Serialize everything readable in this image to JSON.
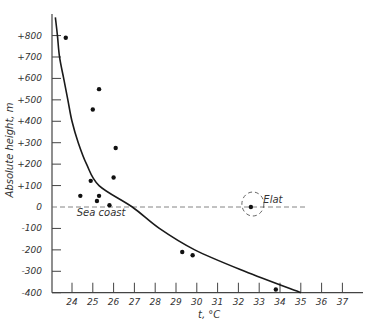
{
  "chart_data": {
    "type": "scatter",
    "title": "",
    "xlabel": "t, °C",
    "ylabel": "Absolute height, m",
    "xlim": [
      23,
      38
    ],
    "ylim": [
      -400,
      900
    ],
    "x_ticks": [
      24,
      25,
      26,
      27,
      28,
      29,
      30,
      31,
      32,
      33,
      34,
      35,
      36,
      37
    ],
    "y_ticks": [
      -400,
      -300,
      -200,
      -100,
      0,
      100,
      200,
      300,
      400,
      500,
      600,
      700,
      800
    ],
    "y_tick_labels": [
      "-400",
      "-300",
      "-200",
      "-100",
      "0",
      "+100",
      "+200",
      "+300",
      "+400",
      "+500",
      "+600",
      "+700",
      "+800"
    ],
    "grid": false,
    "legend": null,
    "series": [
      {
        "name": "Observed stations",
        "type": "scatter",
        "points": [
          {
            "t": 23.7,
            "h": 790
          },
          {
            "t": 25.3,
            "h": 550
          },
          {
            "t": 25.0,
            "h": 455
          },
          {
            "t": 26.1,
            "h": 275
          },
          {
            "t": 26.0,
            "h": 138
          },
          {
            "t": 24.9,
            "h": 122
          },
          {
            "t": 24.4,
            "h": 52
          },
          {
            "t": 25.3,
            "h": 52
          },
          {
            "t": 25.2,
            "h": 28
          },
          {
            "t": 25.8,
            "h": 8
          },
          {
            "t": 32.6,
            "h": 0
          },
          {
            "t": 29.3,
            "h": -210
          },
          {
            "t": 29.8,
            "h": -225
          },
          {
            "t": 33.8,
            "h": -385
          }
        ]
      },
      {
        "name": "Fitted curve",
        "type": "line",
        "points": [
          {
            "t": 23.2,
            "h": 885
          },
          {
            "t": 23.3,
            "h": 800
          },
          {
            "t": 23.4,
            "h": 700
          },
          {
            "t": 23.6,
            "h": 600
          },
          {
            "t": 23.8,
            "h": 500
          },
          {
            "t": 24.0,
            "h": 400
          },
          {
            "t": 24.3,
            "h": 300
          },
          {
            "t": 24.7,
            "h": 200
          },
          {
            "t": 25.3,
            "h": 100
          },
          {
            "t": 26.9,
            "h": 0
          },
          {
            "t": 28.2,
            "h": -100
          },
          {
            "t": 29.9,
            "h": -200
          },
          {
            "t": 32.3,
            "h": -300
          },
          {
            "t": 35.0,
            "h": -400
          }
        ]
      }
    ],
    "reference_lines": [
      {
        "orientation": "horizontal",
        "value": 0,
        "style": "dashed",
        "label": "Sea coast"
      }
    ],
    "annotations": [
      {
        "text": "Sea coast",
        "t": 25.4,
        "h": -40
      },
      {
        "text": "Elat",
        "t": 33.2,
        "h": 20,
        "marker": "dashed-circle",
        "target": {
          "t": 32.6,
          "h": 0
        }
      }
    ]
  }
}
